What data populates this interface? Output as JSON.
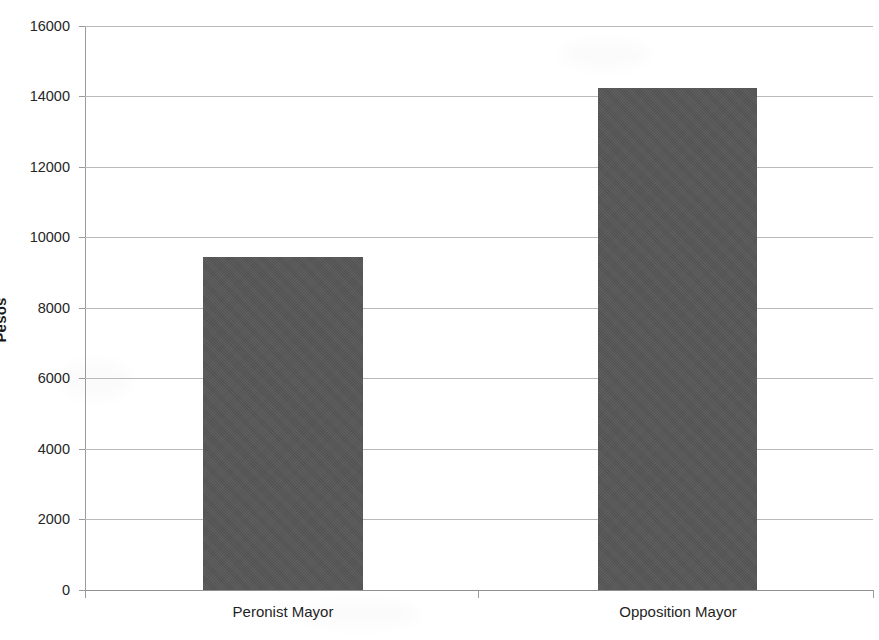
{
  "chart_data": {
    "type": "bar",
    "title": "",
    "subtitle": "",
    "xlabel": "",
    "ylabel": "Pesos",
    "categories": [
      "Peronist Mayor",
      "Opposition Mayor"
    ],
    "values": [
      9440,
      14230
    ],
    "ylim": [
      0,
      16000
    ],
    "ytick_interval": 2000,
    "yticks": [
      "0",
      "2000",
      "4000",
      "6000",
      "8000",
      "10000",
      "12000",
      "14000",
      "16000"
    ],
    "ytick_values": [
      0,
      2000,
      4000,
      6000,
      8000,
      10000,
      12000,
      14000,
      16000
    ],
    "grid": true,
    "grid_axis": "y",
    "legend": null,
    "legend_position": "none",
    "bar_color": "#565656",
    "gridline_color": "#b9b9b9",
    "axis_color": "#8f8f8f",
    "background_color": "#ffffff",
    "text_color": "#1f1f1f",
    "annotations": []
  },
  "axes": {
    "y_title": "Pesos",
    "y_labels": [
      "16000",
      "14000",
      "12000",
      "10000",
      "8000",
      "6000",
      "4000",
      "2000",
      "0"
    ],
    "x_labels": [
      "Peronist Mayor",
      "Opposition Mayor"
    ]
  }
}
